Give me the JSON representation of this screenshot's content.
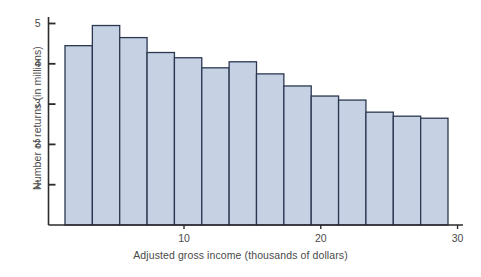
{
  "chart_data": {
    "type": "bar",
    "title": "",
    "subtitle": "",
    "xlabel": "Adjusted gross income (thousands of dollars)",
    "ylabel": "Number of returns (in millions)",
    "xlim": [
      0,
      30.2
    ],
    "ylim": [
      0,
      5.2
    ],
    "grid": false,
    "legend": null,
    "bin_width": 2,
    "bin_edges": [
      1.3,
      3.3,
      5.3,
      7.3,
      9.3,
      11.3,
      13.3,
      15.3,
      17.3,
      19.3,
      21.3,
      23.3,
      25.3,
      27.3,
      29.3
    ],
    "categories": [
      "1.3-3.3",
      "3.3-5.3",
      "5.3-7.3",
      "7.3-9.3",
      "9.3-11.3",
      "11.3-13.3",
      "13.3-15.3",
      "15.3-17.3",
      "17.3-19.3",
      "19.3-21.3",
      "21.3-23.3",
      "23.3-25.3",
      "25.3-27.3",
      "27.3-29.3"
    ],
    "values": [
      4.45,
      4.95,
      4.65,
      4.28,
      4.15,
      3.9,
      4.05,
      3.75,
      3.45,
      3.2,
      3.1,
      2.8,
      2.7,
      2.65
    ],
    "xticks": [
      10,
      20,
      30
    ],
    "xtick_labels": [
      "10",
      "20",
      "30"
    ],
    "yticks": [
      1,
      2,
      3,
      4,
      5
    ],
    "ytick_labels": [
      "1",
      "2",
      "3",
      "4",
      "5"
    ],
    "bar_fill_color": "#c6d2e4",
    "bar_edge_color": "#2b3850",
    "axis_color": "#2b2b2b",
    "text_color": "#4a4a4a",
    "background_color": "#ffffff"
  },
  "axes": {
    "y_tick_labels": [
      "5",
      "4",
      "3",
      "2",
      "1"
    ],
    "x_tick_labels": [
      "10",
      "20",
      "30"
    ],
    "y_axis_title": "Number of returns (in millions)",
    "x_axis_title": "Adjusted gross income (thousands of dollars)"
  }
}
